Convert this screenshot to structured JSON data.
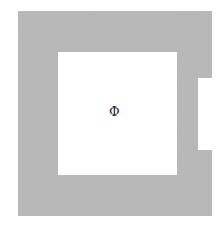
{
  "figure": {
    "canvas": {
      "width": 224,
      "height": 232,
      "background": "#ffffff"
    },
    "shape": {
      "name": "bracket-frame-with-ibeam-notch",
      "fill": "#b8b8b8",
      "texture": "noise",
      "outer": {
        "x": 18,
        "y": 11,
        "width": 194,
        "height": 205
      },
      "inner_cutout": {
        "x": 58,
        "y": 52,
        "width": 119,
        "height": 123
      },
      "right_notch": {
        "wide_right_edge_x": 212,
        "narrow_right_edge_x": 198,
        "notch_top_y": 78,
        "notch_bottom_y": 150,
        "notch_left_x": 198
      },
      "outline_path": "M18,11 L212,11 L212,78 L198,78 L198,150 L212,150 L212,216 L18,216 Z",
      "cutout_path": "M58,52 L177,52 L177,175 L58,175 Z"
    },
    "annotations": [
      {
        "name": "phi-symbol",
        "glyph": "Φ",
        "unicode": "U+03A6",
        "color": "#2b2b2b",
        "x": 114,
        "y": 112
      }
    ]
  }
}
